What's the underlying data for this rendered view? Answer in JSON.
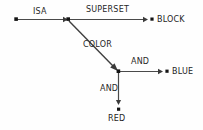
{
  "diagram": {
    "type": "semantic-network",
    "title": "",
    "background_color": "#fefefe",
    "line_color": "#4a4a4a",
    "text_color": "#272727",
    "nodes": [
      {
        "id": "origin",
        "label": "",
        "x": 16,
        "y": 19,
        "kind": "anonymous-dot"
      },
      {
        "id": "superset-hub",
        "label": "",
        "x": 68,
        "y": 19,
        "kind": "junction-dot"
      },
      {
        "id": "block",
        "label": "BLOCK",
        "x": 152,
        "y": 19,
        "kind": "labeled-dot"
      },
      {
        "id": "color-hub",
        "label": "",
        "x": 118,
        "y": 71,
        "kind": "junction-dot"
      },
      {
        "id": "blue",
        "label": "BLUE",
        "x": 167,
        "y": 71,
        "kind": "labeled-dot"
      },
      {
        "id": "red",
        "label": "RED",
        "x": 118,
        "y": 109,
        "kind": "labeled-dot"
      }
    ],
    "edges": [
      {
        "id": "isa",
        "label": "ISA",
        "from": "origin",
        "to": "superset-hub",
        "direction": "right"
      },
      {
        "id": "superset",
        "label": "SUPERSET",
        "from": "superset-hub",
        "to": "block",
        "direction": "right"
      },
      {
        "id": "color",
        "label": "COLOR",
        "from": "superset-hub",
        "to": "color-hub",
        "direction": "diagonal-down-right"
      },
      {
        "id": "and-blue",
        "label": "AND",
        "from": "color-hub",
        "to": "blue",
        "direction": "right"
      },
      {
        "id": "and-red",
        "label": "AND",
        "from": "color-hub",
        "to": "red",
        "direction": "down"
      }
    ],
    "labels": {
      "isa": "ISA",
      "superset": "SUPERSET",
      "color": "COLOR",
      "and_blue": "AND",
      "and_red": "AND",
      "block": "BLOCK",
      "blue": "BLUE",
      "red": "RED"
    }
  }
}
